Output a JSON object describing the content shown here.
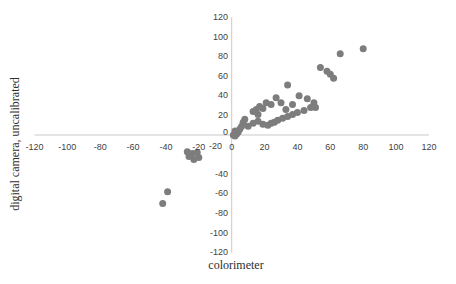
{
  "chart_data": {
    "type": "scatter",
    "title": "",
    "xlabel": "colorimeter",
    "ylabel": "digital camera, uncalibrated",
    "xlim": [
      -120,
      120
    ],
    "ylim": [
      -120,
      120
    ],
    "x_ticks": [
      -120,
      -100,
      -80,
      -60,
      -40,
      -20,
      0,
      20,
      40,
      60,
      80,
      100,
      120
    ],
    "y_ticks": [
      120,
      100,
      80,
      60,
      40,
      20,
      0,
      -20,
      -40,
      -60,
      -80,
      -100,
      -120
    ],
    "grid": false,
    "legend": false,
    "marker_color": "#7d7d7d",
    "axis_color": "#c9c9c9",
    "tick_label_color": "#3f3f3f",
    "points": [
      [
        -42,
        -70
      ],
      [
        -39,
        -58
      ],
      [
        -27,
        -17
      ],
      [
        -24,
        -19
      ],
      [
        -21,
        -18
      ],
      [
        -26,
        -22
      ],
      [
        -23,
        -25
      ],
      [
        -20,
        -23
      ],
      [
        1,
        0
      ],
      [
        2,
        -1
      ],
      [
        3,
        1
      ],
      [
        4,
        3
      ],
      [
        2,
        4
      ],
      [
        5,
        6
      ],
      [
        6,
        9
      ],
      [
        7,
        13
      ],
      [
        8,
        16
      ],
      [
        10,
        9
      ],
      [
        13,
        12
      ],
      [
        16,
        14
      ],
      [
        19,
        11
      ],
      [
        22,
        10
      ],
      [
        24,
        12
      ],
      [
        26,
        13
      ],
      [
        28,
        15
      ],
      [
        31,
        17
      ],
      [
        34,
        19
      ],
      [
        37,
        21
      ],
      [
        40,
        23
      ],
      [
        44,
        25
      ],
      [
        48,
        28
      ],
      [
        13,
        24
      ],
      [
        15,
        26
      ],
      [
        17,
        29
      ],
      [
        16,
        21
      ],
      [
        19,
        27
      ],
      [
        21,
        33
      ],
      [
        24,
        31
      ],
      [
        27,
        38
      ],
      [
        30,
        33
      ],
      [
        33,
        26
      ],
      [
        37,
        31
      ],
      [
        41,
        40
      ],
      [
        46,
        37
      ],
      [
        50,
        33
      ],
      [
        51,
        28
      ],
      [
        34,
        51
      ],
      [
        54,
        69
      ],
      [
        58,
        65
      ],
      [
        60,
        62
      ],
      [
        62,
        58
      ],
      [
        66,
        83
      ],
      [
        80,
        88
      ]
    ]
  }
}
